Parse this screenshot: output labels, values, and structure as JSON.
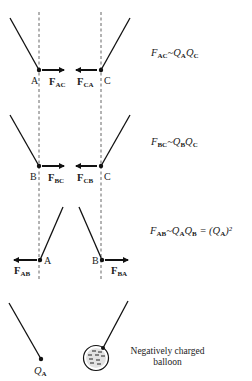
{
  "diagram": {
    "type": "electrostatic-forces-between-charged-pendulums",
    "colors": {
      "ink": "#111111",
      "dashed_line": "#555555",
      "balloon_fill": "#dddddd"
    },
    "rows": [
      {
        "left_label": "A",
        "right_label": "C",
        "left_force": {
          "main": "F",
          "sub": "AC",
          "direction": "right"
        },
        "right_force": {
          "main": "F",
          "sub": "CA",
          "direction": "left"
        },
        "equation": {
          "lhs_main": "F",
          "lhs_sub": "AC",
          "rel": "~",
          "rhs": [
            {
              "main": "Q",
              "sub": "A"
            },
            {
              "main": "Q",
              "sub": "C"
            }
          ]
        },
        "interaction": "attract"
      },
      {
        "left_label": "B",
        "right_label": "C",
        "left_force": {
          "main": "F",
          "sub": "BC",
          "direction": "right"
        },
        "right_force": {
          "main": "F",
          "sub": "CB",
          "direction": "left"
        },
        "equation": {
          "lhs_main": "F",
          "lhs_sub": "BC",
          "rel": "~",
          "rhs": [
            {
              "main": "Q",
              "sub": "B"
            },
            {
              "main": "Q",
              "sub": "C"
            }
          ]
        },
        "interaction": "attract"
      },
      {
        "left_label": "A",
        "right_label": "B",
        "left_force": {
          "main": "F",
          "sub": "AB",
          "direction": "left"
        },
        "right_force": {
          "main": "F",
          "sub": "BA",
          "direction": "right"
        },
        "equation": {
          "lhs_main": "F",
          "lhs_sub": "AB",
          "rel": "~",
          "rhs": [
            {
              "main": "Q",
              "sub": "A"
            },
            {
              "main": "Q",
              "sub": "B"
            }
          ],
          "extra": "= (Q",
          "extra_sub": "A",
          "extra_tail": ")²"
        },
        "interaction": "repel"
      }
    ],
    "bottom": {
      "charge_label_main": "Q",
      "charge_label_sub": "A",
      "balloon_caption_line1": "Negatively charged",
      "balloon_caption_line2": "balloon",
      "balloon_charge_sign": "−"
    }
  }
}
